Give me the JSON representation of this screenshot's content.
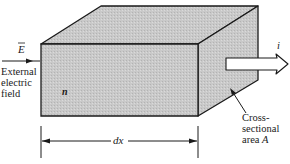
{
  "diagram": {
    "type": "3d-block-conductor",
    "colors": {
      "stroke": "#1a1a1a",
      "front_face": "#c8c8c8",
      "top_face": "#d2d2d2",
      "side_face": "#bcbcbc",
      "arrow_fill": "#ffffff",
      "background": "#ffffff"
    },
    "labels": {
      "field_symbol": "E",
      "field_caption_line1": "External",
      "field_caption_line2": "electric",
      "field_caption_line3": "field",
      "carrier_density": "n",
      "current": "i",
      "area_line1": "Cross-",
      "area_line2": "sectional",
      "area_line3": "area ",
      "area_symbol": "A",
      "length": "dx"
    }
  }
}
